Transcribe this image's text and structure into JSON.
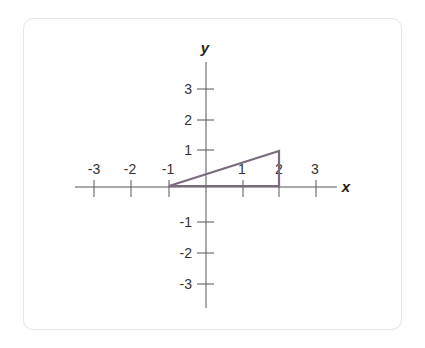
{
  "graph": {
    "x_axis_label": "x",
    "y_axis_label": "y",
    "x_ticks": [
      "-3",
      "-2",
      "-1",
      "1",
      "2",
      "3"
    ],
    "y_ticks": [
      "3",
      "2",
      "1",
      "-1",
      "-2",
      "-3"
    ],
    "triangle": {
      "vertices": [
        [
          -1,
          0
        ],
        [
          2,
          0
        ],
        [
          2,
          1
        ]
      ],
      "stroke_color": "#7a6b7d"
    },
    "axis_color": "#555555"
  }
}
